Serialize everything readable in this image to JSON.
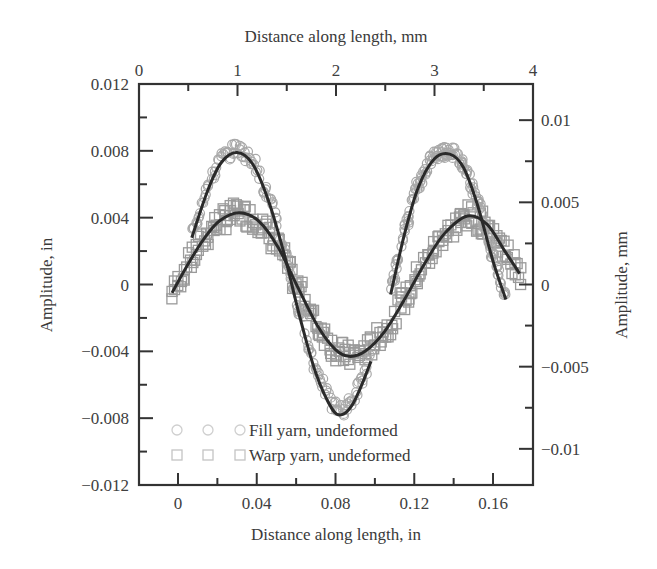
{
  "chart_data": {
    "type": "scatter",
    "title": "",
    "xlabel": "Distance along length, in",
    "ylabel": "Amplitude, in",
    "x2label": "Distance along length, mm",
    "y2label": "Amplitude, mm",
    "xlim": [
      -0.0198,
      0.1803
    ],
    "ylim": [
      -0.012,
      0.012
    ],
    "x2lim": [
      0,
      4
    ],
    "y2lim": [
      -0.0122,
      0.0122
    ],
    "x_ticks": [
      0,
      0.04,
      0.08,
      0.12,
      0.16
    ],
    "x_tick_labels": [
      "0",
      "0.04",
      "0.08",
      "0.12",
      "0.16"
    ],
    "y_ticks": [
      -0.012,
      -0.008,
      -0.004,
      0,
      0.004,
      0.008,
      0.012
    ],
    "y_tick_labels": [
      "−0.012",
      "−0.008",
      "−0.004",
      "0",
      "0.004",
      "0.008",
      "0.012"
    ],
    "x2_ticks": [
      0,
      1,
      2,
      3,
      4
    ],
    "x2_tick_labels": [
      "0",
      "1",
      "2",
      "3",
      "4"
    ],
    "y2_ticks": [
      -0.01,
      -0.005,
      0,
      0.005,
      0.01
    ],
    "y2_tick_labels": [
      "−0.01",
      "−0.005",
      "0",
      "0.005",
      "0.01"
    ],
    "grid": false,
    "legend_position": "lower left",
    "series": [
      {
        "name": "Fill yarn, undeformed",
        "marker": "circle",
        "marker_color": "#a8a8a8",
        "fit_color": "#2a2a2a",
        "fit_segments": [
          {
            "x": [
              0.007,
              0.015,
              0.022,
              0.03,
              0.038,
              0.046,
              0.054,
              0.062,
              0.07,
              0.078,
              0.083,
              0.088,
              0.093,
              0.098
            ],
            "y": [
              0.0028,
              0.0056,
              0.0073,
              0.0079,
              0.0072,
              0.005,
              0.0018,
              -0.002,
              -0.0053,
              -0.0074,
              -0.0078,
              -0.0073,
              -0.0061,
              -0.0046
            ]
          },
          {
            "x": [
              0.108,
              0.115,
              0.122,
              0.13,
              0.138,
              0.145,
              0.152,
              0.16,
              0.1665
            ],
            "y": [
              -0.0006,
              0.003,
              0.0058,
              0.0075,
              0.0078,
              0.007,
              0.0048,
              0.0014,
              -0.0009
            ]
          }
        ],
        "peaks": [
          {
            "x": 0.03,
            "y": 0.0079
          },
          {
            "x": 0.083,
            "y": -0.0078
          },
          {
            "x": 0.138,
            "y": 0.0078
          }
        ]
      },
      {
        "name": "Warp yarn, undeformed",
        "marker": "square",
        "marker_color": "#9a9a9a",
        "fit_color": "#2a2a2a",
        "fit_segments": [
          {
            "x": [
              -0.003,
              0.005,
              0.013,
              0.021,
              0.031,
              0.041,
              0.051,
              0.061,
              0.071,
              0.08,
              0.087,
              0.095,
              0.105,
              0.115,
              0.125,
              0.135,
              0.147,
              0.157,
              0.166,
              0.1735
            ],
            "y": [
              -0.0005,
              0.0012,
              0.0027,
              0.0038,
              0.0043,
              0.0038,
              0.0022,
              -0.0002,
              -0.0025,
              -0.0039,
              -0.0043,
              -0.004,
              -0.0028,
              -0.0009,
              0.0012,
              0.003,
              0.0041,
              0.0036,
              0.002,
              0.00065
            ]
          }
        ],
        "extra_points": [
          {
            "x": 0.174,
            "y": 0.0
          }
        ],
        "peaks": [
          {
            "x": 0.031,
            "y": 0.0043
          },
          {
            "x": 0.087,
            "y": -0.0043
          },
          {
            "x": 0.147,
            "y": 0.0041
          }
        ]
      }
    ]
  },
  "legend": {
    "items": [
      {
        "label": "Fill yarn, undeformed",
        "marker": "circle"
      },
      {
        "label": "Warp yarn, undeformed",
        "marker": "square"
      }
    ]
  }
}
